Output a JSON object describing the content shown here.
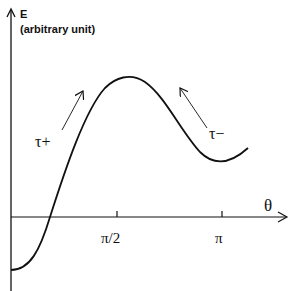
{
  "diagram": {
    "y_axis": {
      "label": "E",
      "sublabel": "(arbitrary unit)"
    },
    "x_axis": {
      "label": "θ",
      "ticks": [
        "π/2",
        "π"
      ]
    },
    "annotations": [
      {
        "text": "τ+",
        "arrow": "up-right"
      },
      {
        "text": "τ−",
        "arrow": "up-left"
      }
    ],
    "curve": "E(θ) energy curve: minimum at θ=0 (negative), rising through zero, maximum near π/2, local minimum near π"
  },
  "colors": {
    "ink": "#111111",
    "background": "#ffffff"
  }
}
